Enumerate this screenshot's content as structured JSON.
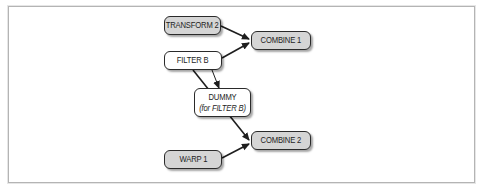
{
  "diagram": {
    "nodes": [
      {
        "id": "transform2",
        "label": "TRANSFORM 2",
        "fill": "gray",
        "x": 164,
        "y": 16,
        "w": 57,
        "h": 19
      },
      {
        "id": "combine1",
        "label": "COMBINE 1",
        "fill": "gray",
        "x": 251,
        "y": 31,
        "w": 60,
        "h": 19
      },
      {
        "id": "filterb",
        "label": "FILTER B",
        "fill": "white",
        "x": 164,
        "y": 51,
        "w": 58,
        "h": 19
      },
      {
        "id": "dummy",
        "label": "DUMMY",
        "sublabel": "(for FILTER B)",
        "fill": "white",
        "x": 194,
        "y": 88,
        "w": 57,
        "h": 29
      },
      {
        "id": "combine2",
        "label": "COMBINE 2",
        "fill": "gray",
        "x": 251,
        "y": 131,
        "w": 60,
        "h": 19
      },
      {
        "id": "warp1",
        "label": "WARP 1",
        "fill": "gray",
        "x": 164,
        "y": 150,
        "w": 58,
        "h": 19
      }
    ],
    "edges": [
      {
        "from": "transform2",
        "to": "combine1"
      },
      {
        "from": "filterb",
        "to": "combine1"
      },
      {
        "from": "filterb",
        "to": "dummy"
      },
      {
        "from": "filterb",
        "to": "combine2",
        "note": "passes behind DUMMY"
      },
      {
        "from": "warp1",
        "to": "combine2"
      }
    ],
    "colors": {
      "gray_fill": "#d5d5d5",
      "white_fill": "#ffffff",
      "stroke": "#1e1e1e",
      "frame": "#b4b4b4"
    }
  }
}
